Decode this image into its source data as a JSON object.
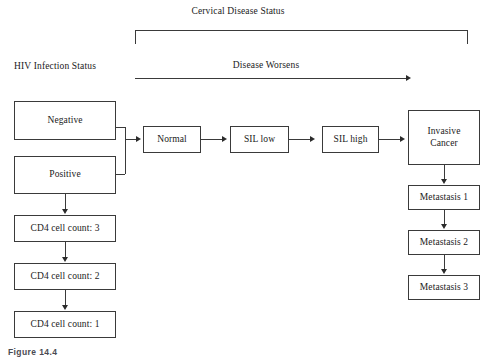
{
  "figure": {
    "caption": "Figure 14.4",
    "top_bracket_label": "Cervical Disease Status",
    "left_axis_label": "HIV Infection Status",
    "progression_arrow_label": "Disease Worsens"
  },
  "hiv_status": {
    "negative": "Negative",
    "positive": "Positive"
  },
  "cd4_chain": [
    {
      "label": "CD4 cell count: 3"
    },
    {
      "label": "CD4 cell count: 2"
    },
    {
      "label": "CD4 cell count: 1"
    }
  ],
  "disease_chain": [
    {
      "label": "Normal"
    },
    {
      "label": "SIL low"
    },
    {
      "label": "SIL high"
    },
    {
      "label": "Invasive\nCancer"
    }
  ],
  "invasive_cancer_label_line1": "Invasive",
  "invasive_cancer_label_line2": "Cancer",
  "metastasis_chain": [
    {
      "label": "Metastasis 1"
    },
    {
      "label": "Metastasis 2"
    },
    {
      "label": "Metastasis 3"
    }
  ],
  "colors": {
    "background": "#ffffff",
    "box_border": "#3a3a3a",
    "line": "#3a3a3a",
    "text": "#1a1a1a",
    "caption_text": "#4a4a52"
  }
}
